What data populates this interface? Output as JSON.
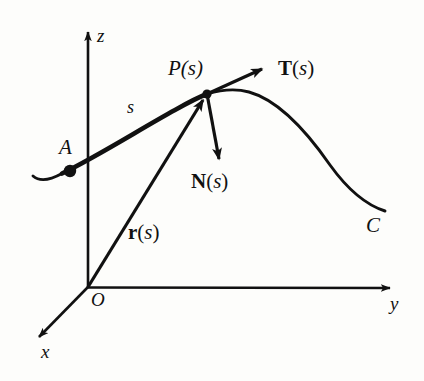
{
  "figure": {
    "background_color": "#fdfdfb",
    "ink_color": "#111111"
  },
  "axes": {
    "x_label": "x",
    "y_label": "y",
    "z_label": "z",
    "origin_label": "O"
  },
  "curve": {
    "name_label": "C",
    "start_point_label": "A",
    "arclength_label": "s",
    "marked_point_label": "P(s)"
  },
  "vectors": {
    "position": {
      "name": "r",
      "arg": "s",
      "paren_open": "(",
      "paren_close": ")",
      "label": "r(s)",
      "style": "bold-upright"
    },
    "tangent": {
      "name": "T",
      "arg": "s",
      "paren_open": "(",
      "paren_close": ")",
      "label": "T(s)",
      "style": "bold-upright"
    },
    "normal": {
      "name": "N",
      "arg": "s",
      "paren_open": "(",
      "paren_close": ")",
      "label": "N(s)",
      "style": "bold-upright"
    }
  },
  "points": {
    "P": {
      "label_text": "P",
      "arg": "s"
    }
  },
  "geometry": {
    "origin": [
      88,
      287
    ],
    "z_axis_tip": [
      88,
      28
    ],
    "y_axis_tip": [
      396,
      288
    ],
    "x_axis_tip": [
      33,
      343
    ],
    "point_P": [
      207,
      94
    ],
    "point_A": [
      70,
      171
    ],
    "curve_start": [
      33,
      176
    ],
    "curve_end": [
      385,
      211
    ],
    "tangent_tip": [
      266,
      67
    ],
    "normal_tip": [
      221,
      166
    ]
  }
}
